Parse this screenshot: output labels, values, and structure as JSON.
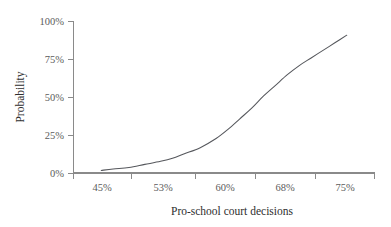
{
  "chart_data": {
    "type": "line",
    "title": "",
    "xlabel": "Pro-school court decisions",
    "ylabel": "Probability",
    "grid": false,
    "legend": false,
    "xlim": [
      41,
      79
    ],
    "ylim": [
      0,
      100
    ],
    "x_tick_labels": [
      "45%",
      "53%",
      "60%",
      "68%",
      "75%"
    ],
    "x_tick_values": [
      45,
      53,
      60,
      68,
      75
    ],
    "y_tick_labels": [
      "0%",
      "25%",
      "50%",
      "75%",
      "100%"
    ],
    "y_tick_values": [
      0,
      25,
      50,
      75,
      100
    ],
    "series": [
      {
        "name": "Probability",
        "color": "#55575c",
        "x": [
          44.5,
          46.0,
          48.0,
          50.0,
          52.0,
          53.5,
          55.0,
          57.0,
          59.0,
          60.5,
          62.0,
          63.5,
          65.0,
          66.5,
          68.0,
          69.5,
          71.0,
          72.5,
          74.0,
          75.5
        ],
        "y": [
          2,
          3,
          4,
          6,
          8,
          10,
          13,
          17,
          23,
          29,
          36,
          43,
          51,
          58,
          65,
          71,
          76,
          81,
          86,
          91
        ]
      }
    ]
  },
  "axes": {
    "y_axis_title": "Probability",
    "x_axis_title": "Pro-school court decisions",
    "axis_color": "#8a8a8a",
    "curve_color": "#55575c",
    "label_color": "#5b5b5b",
    "title_color": "#2e2e2e"
  },
  "y_ticks": [
    {
      "label": "100%",
      "value": 100
    },
    {
      "label": "75%",
      "value": 75
    },
    {
      "label": "50%",
      "value": 50
    },
    {
      "label": "25%",
      "value": 25
    },
    {
      "label": "0%",
      "value": 0
    }
  ],
  "x_ticks": [
    {
      "label": "45%",
      "value": 45
    },
    {
      "label": "53%",
      "value": 53
    },
    {
      "label": "60%",
      "value": 60
    },
    {
      "label": "68%",
      "value": 68
    },
    {
      "label": "75%",
      "value": 75
    }
  ]
}
